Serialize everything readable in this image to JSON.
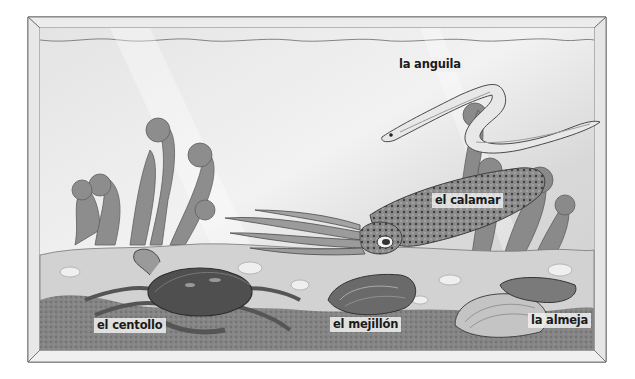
{
  "illustration": {
    "subject": "aquarium-with-sea-creatures",
    "style": "grayscale-watercolor",
    "labels": [
      {
        "id": "eel",
        "text": "la anguila"
      },
      {
        "id": "squid",
        "text": "el calamar"
      },
      {
        "id": "crab",
        "text": "el centollo"
      },
      {
        "id": "mussel",
        "text": "el mejillón"
      },
      {
        "id": "clam",
        "text": "la almeja"
      }
    ]
  },
  "colors": {
    "frame_light": "#eeeeee",
    "frame_line": "#555555",
    "water": "#dcdcdc",
    "sand": "#c8c8c8",
    "seabed_dark": "#7a7a7a",
    "plant": "#8a8a8a",
    "creature_dark": "#4a4a4a",
    "label_text": "#1a1a1a"
  }
}
